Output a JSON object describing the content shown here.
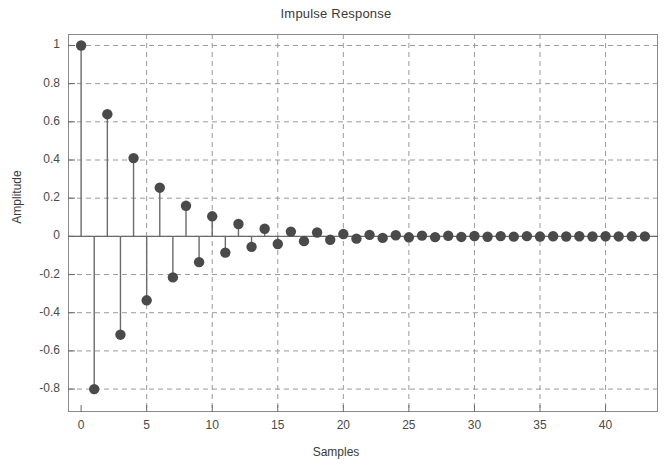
{
  "chart_data": {
    "type": "scatter",
    "plot_style": "stem",
    "title": "Impulse Response",
    "xlabel": "Samples",
    "ylabel": "Amplitude",
    "xlim": [
      -1,
      44
    ],
    "ylim": [
      -0.92,
      1.06
    ],
    "grid": true,
    "grid_style": "dashed",
    "legend": "none",
    "marker": "filled-circle",
    "marker_color": "#4a4a4a",
    "stem_color": "#6b6b6b",
    "baseline": 0,
    "xticks": [
      0,
      5,
      10,
      15,
      20,
      25,
      30,
      35,
      40
    ],
    "xtick_labels": [
      "0",
      "5",
      "10",
      "15",
      "20",
      "25",
      "30",
      "35",
      "40"
    ],
    "yticks": [
      1,
      0.8,
      0.6,
      0.4,
      0.2,
      0,
      -0.2,
      -0.4,
      -0.6,
      -0.8
    ],
    "ytick_labels": [
      "1",
      "0.8",
      "0.6",
      "0.4",
      "0.2",
      "0",
      "-0.2",
      "-0.4",
      "-0.6",
      "-0.8"
    ],
    "x": [
      0,
      1,
      2,
      3,
      4,
      5,
      6,
      7,
      8,
      9,
      10,
      11,
      12,
      13,
      14,
      15,
      16,
      17,
      18,
      19,
      20,
      21,
      22,
      23,
      24,
      25,
      26,
      27,
      28,
      29,
      30,
      31,
      32,
      33,
      34,
      35,
      36,
      37,
      38,
      39,
      40,
      41,
      42,
      43
    ],
    "values": [
      1.0,
      -0.8,
      0.64,
      -0.515,
      0.41,
      -0.335,
      0.255,
      -0.215,
      0.16,
      -0.135,
      0.105,
      -0.085,
      0.065,
      -0.055,
      0.04,
      -0.04,
      0.025,
      -0.025,
      0.02,
      -0.018,
      0.012,
      -0.012,
      0.008,
      -0.008,
      0.006,
      -0.005,
      0.004,
      -0.004,
      0.003,
      -0.003,
      0.002,
      -0.002,
      0.0015,
      -0.0015,
      0.001,
      -0.001,
      0.0008,
      -0.0008,
      0.0005,
      -0.0005,
      0.0004,
      -0.0004,
      0.0003,
      -0.0003
    ]
  },
  "chart": {
    "title": "Impulse Response",
    "xlabel": "Samples",
    "ylabel": "Amplitude"
  }
}
